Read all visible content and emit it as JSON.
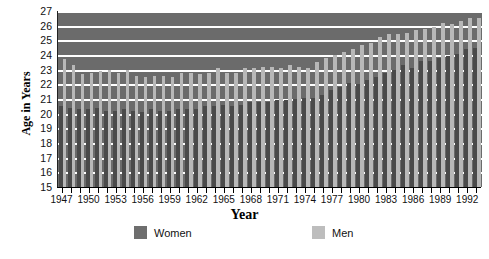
{
  "axes": {
    "ylabel": "Age in Years",
    "xlabel": "Year",
    "yticks": [
      "27",
      "26",
      "25",
      "24",
      "23",
      "22",
      "21",
      "20",
      "19",
      "18",
      "17",
      "16",
      "15"
    ],
    "xtick_labels": [
      "1947",
      "1950",
      "1953",
      "1956",
      "1959",
      "1962",
      "1965",
      "1968",
      "1971",
      "1974",
      "1977",
      "1980",
      "1983",
      "1986",
      "1989",
      "1992"
    ]
  },
  "legend": {
    "women_label": "Women",
    "men_label": "Men",
    "women_color": "#6e6e6e",
    "men_color": "#bdbdbd"
  },
  "style": {
    "plot_background": "#6b6b6b",
    "gridline_color": "#ffffff",
    "women_bar_color": "#4a4a4a",
    "men_bar_color": "#b8b8b8"
  },
  "chart_data": {
    "type": "bar",
    "title": "",
    "xlabel": "Year",
    "ylabel": "Age in Years",
    "ylim": [
      15,
      27
    ],
    "grid": true,
    "legend_position": "bottom",
    "categories": [
      "1947",
      "1948",
      "1949",
      "1950",
      "1951",
      "1952",
      "1953",
      "1954",
      "1955",
      "1956",
      "1957",
      "1958",
      "1959",
      "1960",
      "1961",
      "1962",
      "1963",
      "1964",
      "1965",
      "1966",
      "1967",
      "1968",
      "1969",
      "1970",
      "1971",
      "1972",
      "1973",
      "1974",
      "1975",
      "1976",
      "1977",
      "1978",
      "1979",
      "1980",
      "1981",
      "1982",
      "1983",
      "1984",
      "1985",
      "1986",
      "1987",
      "1988",
      "1989",
      "1990",
      "1991",
      "1992",
      "1993"
    ],
    "series": [
      {
        "name": "Women",
        "values": [
          20.5,
          20.4,
          20.3,
          20.3,
          20.4,
          20.2,
          20.2,
          20.3,
          20.2,
          20.1,
          20.3,
          20.2,
          20.2,
          20.3,
          20.3,
          20.3,
          20.5,
          20.5,
          20.6,
          20.5,
          20.6,
          20.8,
          20.8,
          20.8,
          20.9,
          20.9,
          21.0,
          21.1,
          21.1,
          21.3,
          21.6,
          21.8,
          22.1,
          22.0,
          22.3,
          22.5,
          22.8,
          23.0,
          23.3,
          23.1,
          23.6,
          23.6,
          23.8,
          23.9,
          24.1,
          24.4,
          24.5
        ]
      },
      {
        "name": "Men",
        "values": [
          23.7,
          23.3,
          22.7,
          22.8,
          22.9,
          23.0,
          22.8,
          23.0,
          22.6,
          22.5,
          22.6,
          22.6,
          22.5,
          22.8,
          22.8,
          22.7,
          22.8,
          23.1,
          22.8,
          22.8,
          23.1,
          23.1,
          23.2,
          23.2,
          23.1,
          23.3,
          23.2,
          23.1,
          23.5,
          23.8,
          24.0,
          24.2,
          24.4,
          24.7,
          24.8,
          25.2,
          25.4,
          25.4,
          25.5,
          25.7,
          25.8,
          25.9,
          26.2,
          26.1,
          26.3,
          26.5,
          26.5
        ]
      }
    ]
  }
}
